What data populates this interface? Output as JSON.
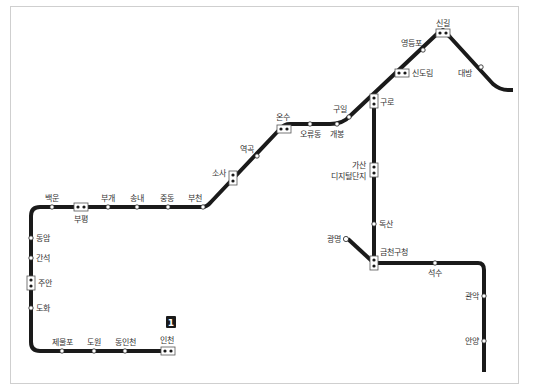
{
  "map": {
    "line_badge": "1",
    "line_color": "#1a1a1a",
    "stations": {
      "singil": "신길",
      "yeongdeungpo": "영등포",
      "sindorim": "신도림",
      "daebang": "대방",
      "guro": "구로",
      "guil": "구일",
      "gaebong": "개봉",
      "oryudong": "오류동",
      "onsu": "온수",
      "yeokgok": "역곡",
      "sosa": "소사",
      "bucheon": "부천",
      "jungdong": "중동",
      "songnae": "송내",
      "bugae": "부개",
      "bupyeong": "부평",
      "baegun": "백운",
      "dongam": "동암",
      "ganseok": "간석",
      "juan": "주안",
      "dohwa": "도화",
      "jemulpo": "제물포",
      "dowon": "도원",
      "dongincheon": "동인천",
      "incheon": "인천",
      "gasan_line1": "가산",
      "gasan_line2": "디지털단지",
      "doksan": "독산",
      "gwangmyeong": "광명",
      "geumcheon_gu_office": "금천구청",
      "seoksu": "석수",
      "gwanak": "관악",
      "anyang": "안양"
    }
  }
}
